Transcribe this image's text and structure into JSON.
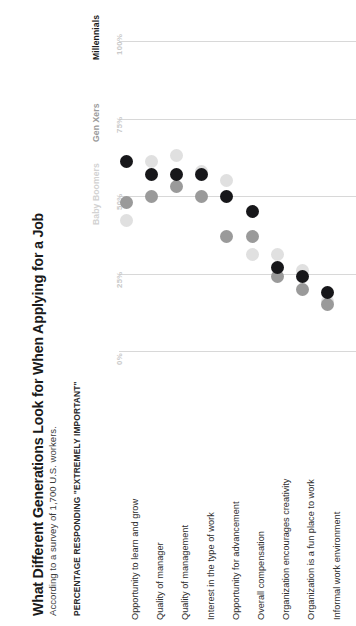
{
  "title": "What Different Generations Look for When Applying for a Job",
  "subtitle": "According to a survey of 1,700 U.S. workers.",
  "axis_title": "PERCENTAGE RESPONDING \"EXTREMELY IMPORTANT\"",
  "legend": {
    "boomers": "Baby Boomers",
    "genxers": "Gen Xers",
    "millennials": "Millennials"
  },
  "colors": {
    "millennials": "#17171a",
    "genxers": "#9a9a9a",
    "boomers": "#e0e0e0",
    "gridline": "#d8d8d8",
    "tick_text": "#c9c9c9"
  },
  "ticks": [
    "0%",
    "25%",
    "50%",
    "75%",
    "100%"
  ],
  "chart_data": {
    "type": "scatter",
    "title": "What Different Generations Look for When Applying for a Job",
    "subtitle": "According to a survey of 1,700 U.S. workers.",
    "xlabel": "",
    "ylabel": "PERCENTAGE RESPONDING \"EXTREMELY IMPORTANT\"",
    "ylim": [
      0,
      100
    ],
    "yticks": [
      0,
      25,
      50,
      75,
      100
    ],
    "ytick_labels": [
      "0%",
      "25%",
      "50%",
      "75%",
      "100%"
    ],
    "grid": true,
    "legend_position": "top",
    "orientation": "rotated-90-ccw",
    "categories": [
      "Opportunity to learn and grow",
      "Quality of manager",
      "Quality of management",
      "Interest in the type of work",
      "Opportunity for advancement",
      "Overall compensation",
      "Organization encourages creativity",
      "Organization is a fun place to work",
      "Informal work environment"
    ],
    "series": [
      {
        "name": "Millennials",
        "color": "#17171a",
        "values": [
          61,
          57,
          57,
          57,
          50,
          45,
          27,
          24,
          19
        ]
      },
      {
        "name": "Gen Xers",
        "color": "#9a9a9a",
        "values": [
          48,
          50,
          53,
          50,
          37,
          37,
          24,
          20,
          15
        ]
      },
      {
        "name": "Baby Boomers",
        "color": "#e0e0e0",
        "values": [
          42,
          61,
          63,
          58,
          55,
          31,
          31,
          26,
          16
        ]
      }
    ]
  },
  "categories_display": [
    "Opportunity to learn and grow",
    "Quality of manager",
    "Quality of management",
    "Interest in the type of work",
    "Opportunity for advancement",
    "Overall compensation",
    "Organization encourages creativity",
    "Organization is a fun place to work",
    "Informal work environment"
  ]
}
